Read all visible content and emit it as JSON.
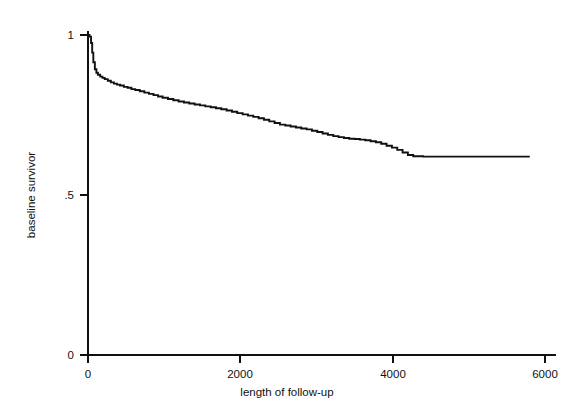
{
  "chart_data": {
    "type": "line",
    "title": "",
    "subtitle": "",
    "xlabel": "length of follow-up",
    "ylabel": "baseline survivor",
    "xlim": [
      0,
      6000
    ],
    "ylim": [
      0,
      1
    ],
    "xticks": [
      0,
      2000,
      4000,
      6000
    ],
    "xticklabels": [
      "0",
      "2000",
      "4000",
      "6000"
    ],
    "yticks": [
      0,
      0.5,
      1
    ],
    "yticklabels": [
      "0",
      ".5",
      "1"
    ],
    "grid": false,
    "legend": null,
    "legend_position": "none",
    "step_style": "step-post",
    "line_color": "#111111",
    "series": [
      {
        "name": "baseline survivor",
        "x": [
          0,
          20,
          40,
          55,
          70,
          90,
          110,
          130,
          160,
          190,
          220,
          260,
          300,
          340,
          380,
          420,
          470,
          520,
          570,
          620,
          680,
          740,
          800,
          860,
          920,
          980,
          1050,
          1120,
          1190,
          1260,
          1330,
          1400,
          1470,
          1540,
          1610,
          1680,
          1750,
          1820,
          1890,
          1960,
          2030,
          2100,
          2170,
          2240,
          2310,
          2380,
          2450,
          2520,
          2590,
          2660,
          2730,
          2800,
          2870,
          2940,
          3010,
          3080,
          3150,
          3220,
          3290,
          3360,
          3430,
          3500,
          3570,
          3640,
          3710,
          3780,
          3850,
          3920,
          3990,
          4060,
          4130,
          4200,
          4270,
          4400,
          4600,
          4800,
          5000,
          5200,
          5400,
          5600,
          5800
        ],
        "y": [
          1.0,
          0.995,
          0.975,
          0.945,
          0.915,
          0.893,
          0.882,
          0.876,
          0.87,
          0.866,
          0.862,
          0.857,
          0.852,
          0.848,
          0.845,
          0.842,
          0.838,
          0.835,
          0.831,
          0.828,
          0.824,
          0.82,
          0.816,
          0.812,
          0.808,
          0.804,
          0.8,
          0.796,
          0.792,
          0.789,
          0.786,
          0.783,
          0.78,
          0.777,
          0.774,
          0.771,
          0.768,
          0.764,
          0.76,
          0.756,
          0.752,
          0.748,
          0.744,
          0.74,
          0.735,
          0.73,
          0.725,
          0.72,
          0.717,
          0.714,
          0.711,
          0.708,
          0.705,
          0.701,
          0.697,
          0.692,
          0.688,
          0.684,
          0.681,
          0.678,
          0.676,
          0.675,
          0.673,
          0.671,
          0.668,
          0.665,
          0.66,
          0.654,
          0.648,
          0.641,
          0.633,
          0.625,
          0.621,
          0.62,
          0.62,
          0.62,
          0.62,
          0.62,
          0.62,
          0.62,
          0.62
        ]
      }
    ],
    "annotations": []
  }
}
